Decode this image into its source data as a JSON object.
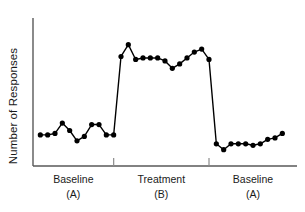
{
  "chart_data": {
    "type": "line",
    "title": "",
    "subtitle": "",
    "xlabel": "",
    "ylabel": "Number of Responses",
    "grid": false,
    "legend": null,
    "xlim": [
      0,
      36
    ],
    "ylim": [
      0,
      10
    ],
    "axis_ticks_shown": false,
    "annotations": [
      "Baseline (A)",
      "Treatment (B)",
      "Baseline (A)"
    ],
    "phases": [
      {
        "name": "Baseline",
        "condition": "(A)",
        "x_start": 0,
        "x_end": 11,
        "session_count": 11,
        "mean_value": 2.2
      },
      {
        "name": "Treatment",
        "condition": "(B)",
        "x_start": 11,
        "x_end": 24,
        "session_count": 13,
        "mean_value": 7.2
      },
      {
        "name": "Baseline",
        "condition": "(A)",
        "x_start": 24,
        "x_end": 36,
        "session_count": 10,
        "mean_value": 1.6
      }
    ],
    "phase_dividers_x": [
      11,
      24
    ],
    "series": [
      {
        "name": "Responses",
        "color": "#000000",
        "marker": "circle",
        "x": [
          1,
          2,
          3,
          4,
          5,
          6,
          7,
          8,
          9,
          10,
          11,
          12,
          13,
          14,
          15,
          16,
          17,
          18,
          19,
          20,
          21,
          22,
          23,
          24,
          25,
          26,
          27,
          28,
          29,
          30,
          31,
          32,
          33,
          34
        ],
        "values": [
          2.1,
          2.1,
          2.2,
          2.9,
          2.4,
          1.7,
          2.0,
          2.8,
          2.8,
          2.1,
          2.1,
          7.4,
          8.2,
          7.2,
          7.3,
          7.3,
          7.3,
          7.1,
          6.6,
          6.9,
          7.3,
          7.7,
          7.9,
          7.2,
          1.5,
          1.1,
          1.5,
          1.5,
          1.5,
          1.4,
          1.5,
          1.8,
          1.9,
          2.2
        ]
      }
    ]
  },
  "axes": {
    "y_axis_label": "Number of Responses",
    "line_color": "#4d4d4d"
  },
  "phase_labels": [
    {
      "name": "Baseline",
      "sub": "(A)"
    },
    {
      "name": "Treatment",
      "sub": "(B)"
    },
    {
      "name": "Baseline",
      "sub": "(A)"
    }
  ]
}
